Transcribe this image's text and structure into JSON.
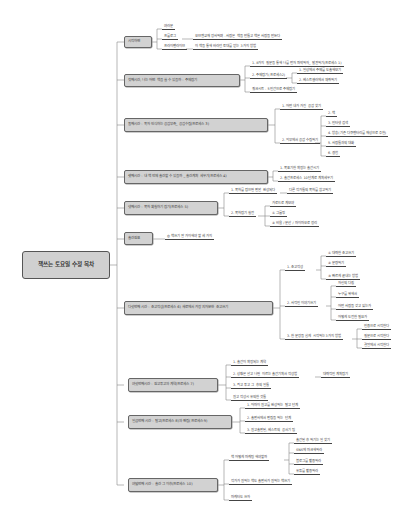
{
  "root": {
    "label": "책쓰는 토요일 수정 목차"
  },
  "branches": [
    {
      "label": "시작하면",
      "children": [
        {
          "label": "여러분"
        },
        {
          "label": "프롤로그",
          "children": [
            {
              "label": "오브젠교재 장사하며 - 사람은 책을 만들고 책은 사람을 만든다"
            }
          ]
        },
        {
          "label": "프라이팬라이브",
          "children": [
            {
              "label": "이 책을 통해 바라던 토대를 얻는 3가지 방법"
            }
          ]
        }
      ]
    },
    {
      "label": "첫째시간, 나는 어떤 책을 쓸 수 있을까 - 주제잡기",
      "children": [
        {
          "label": "1. 8가지 질문을 통해 나를 먼저 파악하자_ 발견하기(프로세스 1)"
        },
        {
          "label": "2. 주제잡기(프로세스2)",
          "children": [
            {
              "label": "1. 일상에서 주제를 도출해보기"
            },
            {
              "label": "2. 베스트셀러에서 채취하기"
            }
          ]
        },
        {
          "label": "워크시트 - 5인간으로 주제잡기"
        }
      ]
    },
    {
      "label": "둘째시간 - 독자 인식하는 공감부족_ 공감수집(프로세스 3)",
      "children": [
        {
          "label": "1. 어떤 내가 가진 공감 찾기"
        },
        {
          "label": "2. 외부에서 공감 수집하기",
          "children": [
            {
              "label": "2. 책"
            },
            {
              "label": "3. 인터넷 검색"
            },
            {
              "label": "4. 방송(기존 다큐멘터리를 재상으로 추천)"
            },
            {
              "label": "5. 사람들과의 대화"
            },
            {
              "label": "6. 경험"
            }
          ]
        }
      ]
    },
    {
      "label": "셋째시간 - 내 책 언제 출간할 수 있을까 _ 출간계획 세우기(프로세스 4)",
      "children": [
        {
          "label": "1. 목표기한 확정는 출간시기"
        },
        {
          "label": "2. 출간프로세스 10단계로 계획세우기"
        }
      ]
    },
    {
      "label": "넷째시간 - 목차 확실하기 잡기(프로세스 5)",
      "children": [
        {
          "label": "1. 목차를 잡으면 편안 완성되다",
          "children": [
            {
              "label": "다른 작가들의 목차를 참고하기"
            }
          ]
        },
        {
          "label": "2. 목차잡기 실전",
          "children": [
            {
              "label": "가로드로 계보야"
            },
            {
              "label": "① 그룹핑"
            },
            {
              "label": "② 비율 / 분산 / 마이마오로 정리"
            }
          ]
        }
      ]
    },
    {
      "label": "출간원표",
      "children": [
        {
          "label": "◎ 책쓰기 잘 가이해야 할 세 가지"
        }
      ]
    },
    {
      "label": "다섯번째 시간 - 초고작성(프로세스 6) 새로에서 가장 지저분한 초고쓰기",
      "children": [
        {
          "label": "1. 초고작성",
          "children": [
            {
              "label": "① 대략한 초고쓰기"
            },
            {
              "label": "② 분량하기"
            },
            {
              "label": "③ 빠르게 끝내는 방법"
            }
          ]
        },
        {
          "label": "2. 사적인 이야기쓰기",
          "children": [
            {
              "label": "자신의 다짐"
            },
            {
              "label": "누구를 위해서"
            },
            {
              "label": "어떤 사람을 갖고 있는가"
            },
            {
              "label": "어떻게 도전한 필요가"
            }
          ]
        },
        {
          "label": "3. 한 문장을 쉽게 시작하는 3가지 방법",
          "children": [
            {
              "label": "인용으로 시작한다"
            },
            {
              "label": "질문으로 시작한다"
            },
            {
              "label": "결말에서 시작한다"
            }
          ]
        }
      ]
    },
    {
      "label": "여섯번째시간 - 원고투고와 계약(프로세스 7)",
      "children": [
        {
          "label": "1. 출간이 확정되는 계약"
        },
        {
          "label": "2. 상황은 알고 나면 이르는 출간기획서 작성법",
          "children": [
            {
              "label": "대략적인 계획잡기"
            }
          ]
        },
        {
          "label": "3. 최고 투고 그 후의 일들"
        },
        {
          "label": "원고 작성시 유의한 것들"
        }
      ]
    },
    {
      "label": "일곱번째 시간 - 탈고(프로세스 8)와 편집(프로세스 9)",
      "children": [
        {
          "label": "1. 아마이 원고를 완성하는 탈고 단계"
        },
        {
          "label": "2. 출판사에서 편집을 하는 단계"
        },
        {
          "label": "3. 원고출판된, 베스트의 공서기 팁"
        }
      ]
    },
    {
      "label": "여덟번째 시간 - 출간 그 이후(프로세스 10)",
      "children": [
        {
          "label": "책 어떻게 마케팅 해야할까",
          "children": [
            {
              "label": "출간된 후 하기는 일 찾기"
            },
            {
              "label": "SNS에 마크해하라"
            },
            {
              "label": "블로그를 활용하라"
            },
            {
              "label": "유튜를 활용하라"
            }
          ]
        },
        {
          "label": "작가가 원하는 책도 출판사가 원하는 책쓰기"
        },
        {
          "label": "마케터도 쓰자"
        }
      ]
    }
  ]
}
